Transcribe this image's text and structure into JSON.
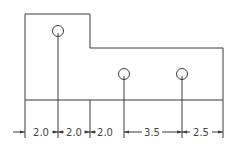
{
  "drawing": {
    "type": "hole-location dimension drawing",
    "dimensions": [
      {
        "id": "d1",
        "label": "2.0"
      },
      {
        "id": "d2",
        "label": "2.0"
      },
      {
        "id": "d3",
        "label": "2.0"
      },
      {
        "id": "d4",
        "label": "3.5"
      },
      {
        "id": "d5",
        "label": "2.5"
      }
    ],
    "holes": [
      {
        "id": "hole-1"
      },
      {
        "id": "hole-2"
      },
      {
        "id": "hole-3"
      }
    ],
    "colors": {
      "line": "#3a3a3a",
      "text": "#444444",
      "background": "#ffffff"
    }
  }
}
